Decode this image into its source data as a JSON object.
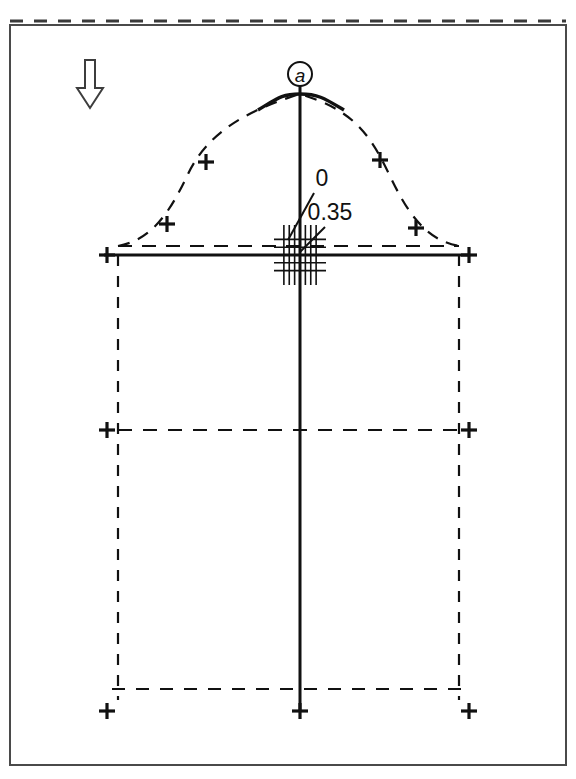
{
  "figure": {
    "type": "engineering-section-drawing",
    "title_fragment": "",
    "background_color": "#ffffff",
    "line_color": "#111111",
    "frame": {
      "name": "drawing-border",
      "x": 10,
      "y": 25,
      "width": 556,
      "height": 740,
      "stroke_width": 2
    },
    "top_dashed_edge": {
      "name": "top-dashed-edge",
      "y": 21,
      "x1": 10,
      "x2": 566
    }
  },
  "annotations": {
    "node_label": {
      "text": "a",
      "cx": 300,
      "cy": 74,
      "r": 12
    },
    "flow_arrow": {
      "name": "downward-flow-arrow",
      "x": 90,
      "y_top": 60,
      "y_bottom": 108,
      "direction": "down",
      "style": "hollow-outline"
    },
    "value_labels": [
      {
        "text": "0",
        "x": 322,
        "y": 186,
        "leader_from": [
          314,
          193
        ],
        "leader_to": [
          288,
          240
        ]
      },
      {
        "text": "0.35",
        "x": 330,
        "y": 220,
        "leader_from": [
          325,
          227
        ],
        "leader_to": [
          300,
          252
        ]
      }
    ]
  },
  "geometry": {
    "centerline": {
      "name": "vertical-centerline",
      "x": 300,
      "y_top": 86,
      "y_bottom": 711
    },
    "baseline": {
      "name": "solid-baseline",
      "y": 255,
      "x1": 104,
      "x2": 470
    },
    "dashed_baseline": {
      "name": "dashed-upper-baseline",
      "y": 246,
      "x1": 118,
      "x2": 459
    },
    "left_rail": {
      "name": "left-vertical-rail",
      "x": 118,
      "y_top": 255,
      "y_bottom": 700
    },
    "right_rail": {
      "name": "right-vertical-rail",
      "x": 459,
      "y_top": 255,
      "y_bottom": 700
    },
    "mid_dashed_row": {
      "name": "mid-dashed-horizontal",
      "y": 430,
      "x1": 118,
      "x2": 459
    },
    "bottom_dashed_row": {
      "name": "bottom-dashed-horizontal",
      "y": 689,
      "x1": 112,
      "x2": 466
    },
    "crest_curve": {
      "name": "crest-profile-curve",
      "apex_x": 300,
      "apex_y": 94,
      "left_end_x": 118,
      "right_end_x": 459,
      "end_y": 246,
      "solid_span_x": [
        258,
        344
      ]
    },
    "grid_marker": {
      "name": "center-grid-marker",
      "cx": 300,
      "cy": 255,
      "half_width": 26,
      "half_height": 30,
      "vertical_count": 7,
      "horizontal_count": 5
    }
  },
  "markers": {
    "name": "cross-markers",
    "size": 8,
    "points": [
      {
        "name": "cross-curve-left-outer",
        "x": 167,
        "y": 224
      },
      {
        "name": "cross-curve-left-inner",
        "x": 206,
        "y": 162
      },
      {
        "name": "cross-curve-right-inner",
        "x": 380,
        "y": 160
      },
      {
        "name": "cross-curve-right-outer",
        "x": 416,
        "y": 228
      },
      {
        "name": "cross-baseline-left",
        "x": 107,
        "y": 255
      },
      {
        "name": "cross-baseline-right",
        "x": 469,
        "y": 255
      },
      {
        "name": "cross-mid-left",
        "x": 107,
        "y": 430
      },
      {
        "name": "cross-mid-right",
        "x": 469,
        "y": 430
      },
      {
        "name": "cross-bottom-left",
        "x": 107,
        "y": 711
      },
      {
        "name": "cross-bottom-center",
        "x": 300,
        "y": 711
      },
      {
        "name": "cross-bottom-right",
        "x": 469,
        "y": 711
      }
    ]
  }
}
